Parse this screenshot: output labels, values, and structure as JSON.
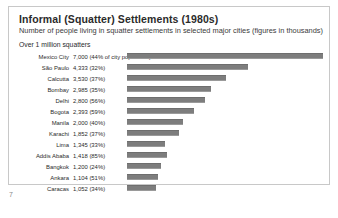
{
  "page": {
    "number": "7"
  },
  "chart_data": {
    "type": "bar",
    "title": "Informal (Squatter) Settlements (1980s)",
    "subtitle": "Number of people living in squatter settlements in selected major cities (figures in thousands)",
    "section_heading": "Over 1 million squatters",
    "orientation": "horizontal",
    "xlabel": "",
    "ylabel": "",
    "grid": false,
    "legend": "none",
    "unit": "thousands",
    "xlim": [
      0,
      7000
    ],
    "bar_color": "#7d7d7d",
    "categories": [
      "Mexico City",
      "São Paulo",
      "Calcutta",
      "Bombay",
      "Delhi",
      "Bogota",
      "Manila",
      "Karachi",
      "Lima",
      "Addis Ababa",
      "Bangkok",
      "Ankara",
      "Caracas"
    ],
    "values": [
      7000,
      4333,
      3530,
      2985,
      2800,
      2393,
      2000,
      1852,
      1345,
      1418,
      1200,
      1104,
      1052
    ],
    "percent_of_city_population": [
      44,
      32,
      37,
      35,
      56,
      59,
      40,
      37,
      33,
      85,
      24,
      51,
      34
    ],
    "rows": [
      {
        "city": "Mexico City",
        "value": 7000,
        "value_label": "7,000 (44% of city population)"
      },
      {
        "city": "São Paulo",
        "value": 4333,
        "value_label": "4,333 (32%)"
      },
      {
        "city": "Calcutta",
        "value": 3530,
        "value_label": "3,530 (37%)"
      },
      {
        "city": "Bombay",
        "value": 2985,
        "value_label": "2,985 (35%)"
      },
      {
        "city": "Delhi",
        "value": 2800,
        "value_label": "2,800 (56%)"
      },
      {
        "city": "Bogota",
        "value": 2393,
        "value_label": "2,393 (59%)"
      },
      {
        "city": "Manila",
        "value": 2000,
        "value_label": "2,000 (40%)"
      },
      {
        "city": "Karachi",
        "value": 1852,
        "value_label": "1,852 (37%)"
      },
      {
        "city": "Lima",
        "value": 1345,
        "value_label": "1,345 (33%)"
      },
      {
        "city": "Addis Ababa",
        "value": 1418,
        "value_label": "1,418 (85%)"
      },
      {
        "city": "Bangkok",
        "value": 1200,
        "value_label": "1,200 (24%)"
      },
      {
        "city": "Ankara",
        "value": 1104,
        "value_label": "1,104 (51%)"
      },
      {
        "city": "Caracas",
        "value": 1052,
        "value_label": "1,052 (34%)"
      }
    ]
  }
}
